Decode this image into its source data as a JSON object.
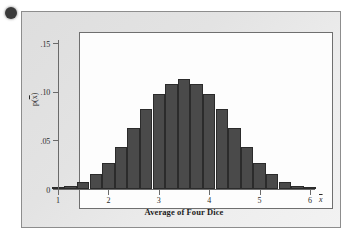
{
  "figure": {
    "bullet_marker": "•"
  },
  "chart_data": {
    "type": "bar",
    "title": "",
    "xlabel": "Average of Four Dice",
    "ylabel": "p(x̄)",
    "x_variable_symbol": "x̄",
    "categories": [
      "1.00",
      "1.25",
      "1.50",
      "1.75",
      "2.00",
      "2.25",
      "2.50",
      "2.75",
      "3.00",
      "3.25",
      "3.50",
      "3.75",
      "4.00",
      "4.25",
      "4.50",
      "4.75",
      "5.00",
      "5.25",
      "5.50",
      "5.75",
      "6.00"
    ],
    "values": [
      0.0008,
      0.0031,
      0.0077,
      0.0154,
      0.027,
      0.0432,
      0.0625,
      0.0818,
      0.098,
      0.108,
      0.1127,
      0.108,
      0.098,
      0.0818,
      0.0625,
      0.0432,
      0.027,
      0.0154,
      0.0077,
      0.0031,
      0.0008
    ],
    "xlim": [
      1.0,
      6.0
    ],
    "ylim": [
      0,
      0.15
    ],
    "x_ticks": [
      "1",
      "2",
      "3",
      "4",
      "5",
      "6"
    ],
    "x_tick_values": [
      1,
      2,
      3,
      4,
      5,
      6
    ],
    "y_ticks": [
      ".15",
      ".10",
      ".05",
      "0"
    ],
    "y_tick_values": [
      0.15,
      0.1,
      0.05,
      0
    ],
    "grid": false,
    "legend": false,
    "bar_color": "#4a4a4a",
    "axis_color": "#6a6a6a"
  }
}
